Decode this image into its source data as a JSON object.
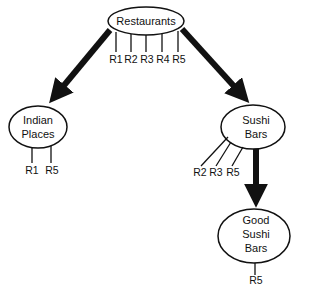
{
  "diagram": {
    "type": "tree",
    "nodes": {
      "root": {
        "lines": [
          "Restaurants"
        ],
        "items": [
          "R1",
          "R2",
          "R3",
          "R4",
          "R5"
        ]
      },
      "indian": {
        "lines": [
          "Indian",
          "Places"
        ],
        "items": [
          "R1",
          "R5"
        ]
      },
      "sushi": {
        "lines": [
          "Sushi",
          "Bars"
        ],
        "items": [
          "R2",
          "R3",
          "R5"
        ]
      },
      "good_sushi": {
        "lines": [
          "Good",
          "Sushi",
          "Bars"
        ],
        "items": [
          "R5"
        ]
      }
    },
    "edges": [
      {
        "from": "Restaurants",
        "to": "Indian Places"
      },
      {
        "from": "Restaurants",
        "to": "Sushi Bars"
      },
      {
        "from": "Sushi Bars",
        "to": "Good Sushi Bars"
      }
    ],
    "colors": {
      "stroke": "#111111",
      "background": "#ffffff"
    }
  }
}
